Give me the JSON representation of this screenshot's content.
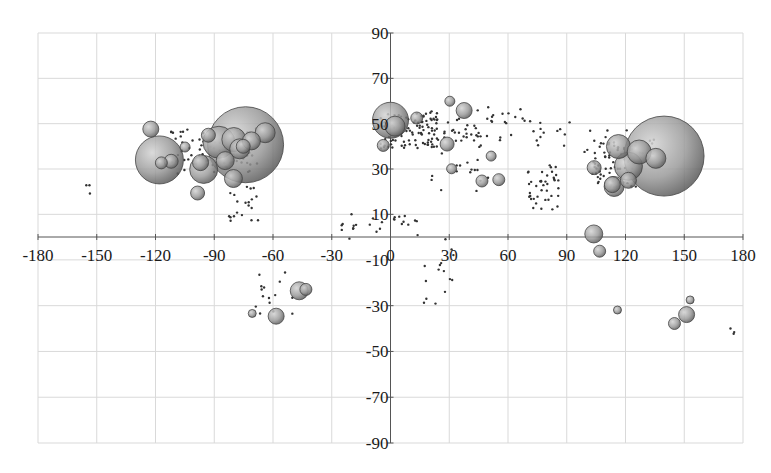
{
  "chart_data": {
    "type": "scatter",
    "subtype": "bubble",
    "title": "",
    "xlabel": "",
    "ylabel": "",
    "xlim": [
      -180,
      180
    ],
    "ylim": [
      -90,
      90
    ],
    "grid": true,
    "legend": "none",
    "x_ticks": [
      -180,
      -150,
      -120,
      -90,
      -60,
      -30,
      0,
      30,
      60,
      90,
      120,
      150,
      180
    ],
    "y_ticks": [
      90,
      70,
      50,
      30,
      10,
      -10,
      -30,
      -50,
      -70,
      -90
    ],
    "x_tick_labels": [
      "-180",
      "-150",
      "-120",
      "-90",
      "-60",
      "-30",
      "0",
      "30",
      "60",
      "90",
      "120",
      "150",
      "180"
    ],
    "y_tick_labels": [
      "90",
      "70",
      "50",
      "30",
      "10",
      "-10",
      "-30",
      "-50",
      "-70",
      "-90"
    ],
    "bubble_color": "#8a8a8a",
    "series": [
      {
        "name": "large bubbles",
        "points": [
          {
            "x": -74,
            "y": 40.7,
            "r": 38
          },
          {
            "x": -118,
            "y": 34,
            "r": 24
          },
          {
            "x": -87.6,
            "y": 41.8,
            "r": 16
          },
          {
            "x": -95.4,
            "y": 29.8,
            "r": 14
          },
          {
            "x": -80,
            "y": 43,
            "r": 12
          },
          {
            "x": -77,
            "y": 38.9,
            "r": 10
          },
          {
            "x": -71,
            "y": 42.4,
            "r": 9
          },
          {
            "x": -84.4,
            "y": 33.7,
            "r": 9
          },
          {
            "x": -97,
            "y": 32.8,
            "r": 8
          },
          {
            "x": -80.2,
            "y": 25.8,
            "r": 9
          },
          {
            "x": -122.4,
            "y": 47.6,
            "r": 8
          },
          {
            "x": -112,
            "y": 33.4,
            "r": 7
          },
          {
            "x": -104.9,
            "y": 39.7,
            "r": 5
          },
          {
            "x": -93,
            "y": 44.9,
            "r": 7
          },
          {
            "x": -75.2,
            "y": 40,
            "r": 7
          },
          {
            "x": -117,
            "y": 32.7,
            "r": 6
          },
          {
            "x": -98.5,
            "y": 19.4,
            "r": 7
          },
          {
            "x": -64,
            "y": 46,
            "r": 10
          },
          {
            "x": 139.7,
            "y": 35.7,
            "r": 40
          },
          {
            "x": 121.5,
            "y": 31.2,
            "r": 14
          },
          {
            "x": 116.4,
            "y": 39.9,
            "r": 12
          },
          {
            "x": 127,
            "y": 37.5,
            "r": 12
          },
          {
            "x": 114.2,
            "y": 22.3,
            "r": 10
          },
          {
            "x": 121.5,
            "y": 25,
            "r": 8
          },
          {
            "x": 135.5,
            "y": 34.7,
            "r": 10
          },
          {
            "x": 113.3,
            "y": 23.1,
            "r": 8
          },
          {
            "x": 104,
            "y": 30.6,
            "r": 7
          },
          {
            "x": 0,
            "y": 51.5,
            "r": 18
          },
          {
            "x": 2.3,
            "y": 48.9,
            "r": 10
          },
          {
            "x": -3.7,
            "y": 40.4,
            "r": 6
          },
          {
            "x": 13.4,
            "y": 52.5,
            "r": 6
          },
          {
            "x": 37.6,
            "y": 55.8,
            "r": 8
          },
          {
            "x": 28.9,
            "y": 41,
            "r": 7
          },
          {
            "x": 30.3,
            "y": 59.9,
            "r": 5
          },
          {
            "x": 51.4,
            "y": 35.7,
            "r": 5
          },
          {
            "x": 46.7,
            "y": 24.7,
            "r": 6
          },
          {
            "x": 55.3,
            "y": 25.3,
            "r": 6
          },
          {
            "x": 31.2,
            "y": 30.1,
            "r": 5
          },
          {
            "x": 103.8,
            "y": 1.35,
            "r": 9
          },
          {
            "x": 106.8,
            "y": -6.2,
            "r": 6
          },
          {
            "x": 151.2,
            "y": -33.9,
            "r": 8
          },
          {
            "x": 145,
            "y": -37.8,
            "r": 6
          },
          {
            "x": 153,
            "y": -27.5,
            "r": 4
          },
          {
            "x": 115.9,
            "y": -31.9,
            "r": 4
          },
          {
            "x": -46.6,
            "y": -23.5,
            "r": 9
          },
          {
            "x": -43.2,
            "y": -22.9,
            "r": 6
          },
          {
            "x": -58.4,
            "y": -34.6,
            "r": 8
          },
          {
            "x": -70.6,
            "y": -33.4,
            "r": 4
          }
        ]
      }
    ]
  }
}
